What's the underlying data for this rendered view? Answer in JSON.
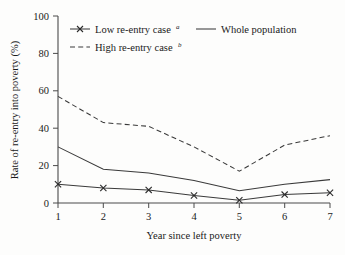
{
  "chart_data": {
    "type": "line",
    "title": "",
    "xlabel": "Year since left poverty",
    "ylabel": "Rate of re-entry into poverty (%)",
    "x": [
      1,
      2,
      3,
      4,
      5,
      6,
      7
    ],
    "xticklabels": [
      "1",
      "2",
      "3",
      "4",
      "5",
      "6",
      "7"
    ],
    "yticklabels": [
      "0",
      "20",
      "40",
      "60",
      "80",
      "100"
    ],
    "yticks": [
      0,
      20,
      40,
      60,
      80,
      100
    ],
    "xlim": [
      1,
      7
    ],
    "ylim": [
      0,
      100
    ],
    "grid": false,
    "legend_position": "top-inside",
    "series": [
      {
        "name": "Low re-entry case",
        "name_superscript": "a",
        "style": "solid-with-x-markers",
        "marker": "x",
        "color": "#3a3a3a",
        "values": [
          10,
          8,
          7,
          4,
          1.5,
          4.5,
          5.5
        ]
      },
      {
        "name": "High re-entry case",
        "name_superscript": "b",
        "style": "dashed",
        "marker": "none",
        "color": "#3a3a3a",
        "values": [
          57,
          43,
          41,
          30,
          17,
          31,
          36
        ]
      },
      {
        "name": "Whole population",
        "name_superscript": "",
        "style": "solid",
        "marker": "none",
        "color": "#3a3a3a",
        "values": [
          30,
          18,
          16,
          12,
          6.5,
          10,
          12.5
        ]
      }
    ]
  },
  "legend": {
    "entries": [
      {
        "label": "Low re-entry case",
        "sup": "a"
      },
      {
        "label": "Whole population",
        "sup": ""
      },
      {
        "label": "High re-entry case",
        "sup": "b"
      }
    ]
  },
  "axes": {
    "x_title": "Year since left poverty",
    "y_title": "Rate of re-entry into poverty (%)"
  }
}
